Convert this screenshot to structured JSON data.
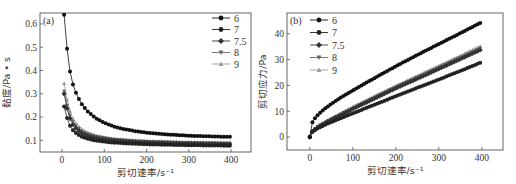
{
  "chart_data": [
    {
      "type": "line",
      "panel_label": "(a)",
      "title": "",
      "xlabel": "剪切速率/s⁻¹",
      "ylabel": "黏度/Pa • s",
      "xlim": [
        -52,
        447
      ],
      "ylim": [
        0.05,
        0.647
      ],
      "xticks": [
        0,
        100,
        200,
        300,
        400
      ],
      "yticks": [
        0.1,
        0.2,
        0.3,
        0.4,
        0.5,
        0.6
      ],
      "ytick_labels": [
        "0.1",
        "0.2",
        "0.3",
        "0.4",
        "0.5",
        "0.6"
      ],
      "grid": false,
      "legend_position": "upper right",
      "x": [
        5,
        15,
        25,
        35,
        45,
        60,
        80,
        100,
        125,
        150,
        175,
        200,
        250,
        300,
        350,
        400
      ],
      "series": [
        {
          "name": "6",
          "marker": "circle",
          "color": "#111111",
          "values": [
            0.64,
            0.43,
            0.345,
            0.295,
            0.26,
            0.225,
            0.195,
            0.175,
            0.158,
            0.147,
            0.139,
            0.133,
            0.125,
            0.12,
            0.117,
            0.115
          ]
        },
        {
          "name": "7",
          "marker": "circle",
          "color": "#222222",
          "values": [
            0.245,
            0.175,
            0.145,
            0.128,
            0.117,
            0.107,
            0.099,
            0.094,
            0.09,
            0.087,
            0.085,
            0.083,
            0.081,
            0.079,
            0.078,
            0.077
          ]
        },
        {
          "name": "7.5",
          "marker": "diamond",
          "color": "#333333",
          "values": [
            0.3,
            0.21,
            0.17,
            0.148,
            0.133,
            0.12,
            0.11,
            0.104,
            0.099,
            0.096,
            0.093,
            0.091,
            0.088,
            0.086,
            0.085,
            0.084
          ]
        },
        {
          "name": "8",
          "marker": "triangle-down",
          "color": "#666666",
          "values": [
            0.31,
            0.225,
            0.182,
            0.158,
            0.142,
            0.128,
            0.117,
            0.11,
            0.104,
            0.1,
            0.097,
            0.095,
            0.092,
            0.09,
            0.088,
            0.087
          ]
        },
        {
          "name": "9",
          "marker": "triangle-up",
          "color": "#999999",
          "values": [
            0.345,
            0.245,
            0.195,
            0.168,
            0.15,
            0.134,
            0.122,
            0.114,
            0.107,
            0.103,
            0.1,
            0.098,
            0.095,
            0.093,
            0.091,
            0.09
          ]
        }
      ]
    },
    {
      "type": "line",
      "panel_label": "(b)",
      "title": "",
      "xlabel": "剪切速率/s⁻¹",
      "ylabel": "剪切应力/Pa",
      "xlim": [
        -53,
        449
      ],
      "ylim": [
        -5,
        48
      ],
      "xticks": [
        0,
        100,
        200,
        300,
        400
      ],
      "yticks": [
        0,
        10,
        20,
        30,
        40
      ],
      "ytick_labels": [
        "0",
        "10",
        "20",
        "30",
        "40"
      ],
      "grid": false,
      "legend_position": "upper left",
      "x": [
        0,
        5,
        15,
        25,
        35,
        50,
        75,
        100,
        150,
        200,
        250,
        300,
        350,
        400
      ],
      "series": [
        {
          "name": "6",
          "marker": "circle",
          "color": "#111111",
          "values": [
            0,
            5.5,
            8.0,
            9.6,
            11.0,
            12.8,
            15.6,
            18.0,
            22.8,
            27.4,
            31.8,
            36.0,
            40.2,
            44.5
          ]
        },
        {
          "name": "7",
          "marker": "circle",
          "color": "#222222",
          "values": [
            0,
            1.8,
            3.0,
            3.9,
            4.7,
            5.8,
            7.5,
            9.2,
            12.5,
            15.8,
            19.1,
            22.3,
            25.6,
            29.0
          ]
        },
        {
          "name": "7.5",
          "marker": "diamond",
          "color": "#333333",
          "values": [
            0,
            2.0,
            3.4,
            4.5,
            5.4,
            6.7,
            8.8,
            10.9,
            14.9,
            18.9,
            22.6,
            26.4,
            30.2,
            34.0
          ]
        },
        {
          "name": "8",
          "marker": "triangle-down",
          "color": "#666666",
          "values": [
            0,
            2.1,
            3.6,
            4.7,
            5.6,
            7.0,
            9.2,
            11.3,
            15.4,
            19.4,
            23.2,
            27.0,
            30.8,
            34.6
          ]
        },
        {
          "name": "9",
          "marker": "triangle-up",
          "color": "#999999",
          "values": [
            0,
            2.2,
            3.7,
            4.9,
            5.8,
            7.2,
            9.4,
            11.6,
            15.8,
            19.8,
            23.7,
            27.6,
            31.5,
            35.5
          ]
        }
      ]
    }
  ]
}
